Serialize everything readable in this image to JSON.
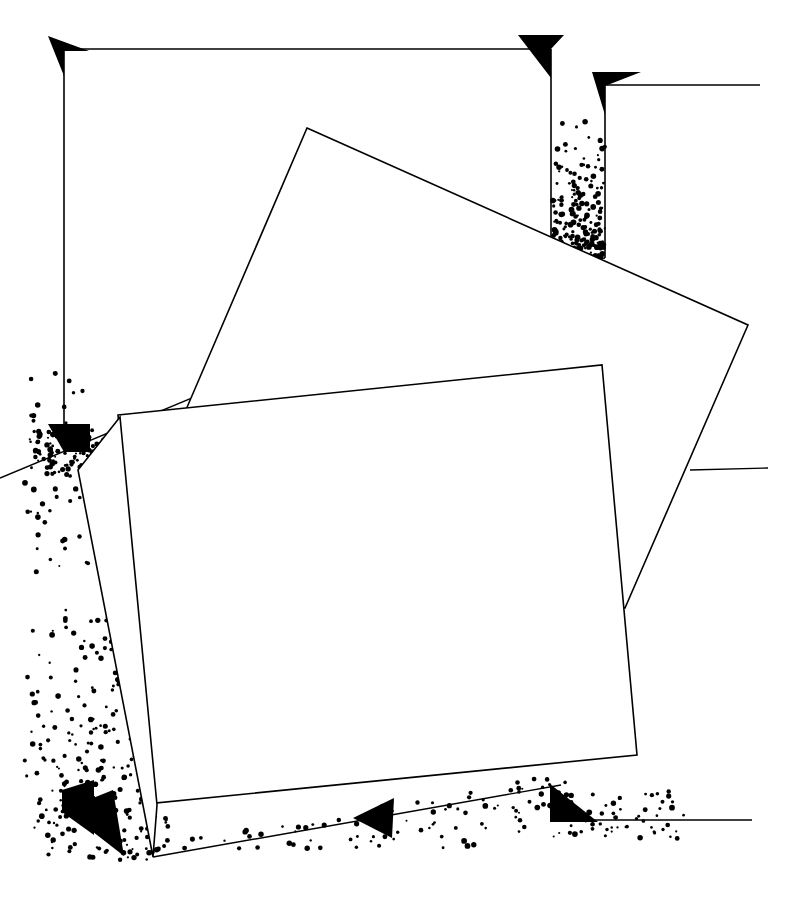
{
  "figure": {
    "background_color": "#ffffff",
    "ink_color": "#000000",
    "canvas": {
      "width": 786,
      "height": 904
    },
    "line_weight_main": 1.6,
    "line_weight_thin": 1.4
  },
  "chart_data": {
    "type": "diagram",
    "xlabel": "",
    "ylabel": "",
    "background": "#ffffff",
    "ink": "#000000",
    "xlim": [
      0,
      786
    ],
    "ylim": [
      0,
      904
    ],
    "grid": false,
    "legend": "none",
    "annotations": [
      "top-left corner bracket with down-left arrowhead",
      "top-right vertical channel filled with granular stipple",
      "mid-left arrowhead at panel edge with granular band",
      "bottom-left paired arrowheads in dense granular field",
      "bottom-center small left-pointing arrowhead on slope",
      "bottom-right arrowhead meeting horizontal baseline",
      "mid-right horizontal leader line touching upper panel edge"
    ]
  },
  "outline_frame": {
    "name": "outer-bracket-frame",
    "description": "Open rectangular bracket: vertical left rail, top rail, and right rail descending into the spill channel.",
    "left_rail": {
      "x": 64,
      "y_top": 48,
      "y_bottom": 434
    },
    "top_rail": {
      "y": 49,
      "x_left": 64,
      "x_right": 551
    },
    "right_rail": {
      "x": 551,
      "y_top": 49,
      "y_bottom": 248
    },
    "second_rail": {
      "x": 605,
      "y_top": 86,
      "y_bottom": 258
    },
    "top_right_leader": {
      "y": 85,
      "x_left": 605,
      "x_right": 760
    }
  },
  "panels": [
    {
      "name": "upper-tilted-panel",
      "corners": [
        {
          "x": 307,
          "y": 128
        },
        {
          "x": 748,
          "y": 325
        },
        {
          "x": 625,
          "y": 608
        },
        {
          "x": 185,
          "y": 412
        }
      ],
      "rotation_note": "rotated clockwise approximately 24 degrees"
    },
    {
      "name": "lower-tilted-panel",
      "corners": [
        {
          "x": 118,
          "y": 415
        },
        {
          "x": 602,
          "y": 365
        },
        {
          "x": 637,
          "y": 755
        },
        {
          "x": 155,
          "y": 803
        }
      ],
      "rotation_note": "rotated counter-clockwise approximately 6 degrees"
    },
    {
      "name": "lower-panel-shadow-edge",
      "corners": [
        {
          "x": 78,
          "y": 470
        },
        {
          "x": 120,
          "y": 417
        },
        {
          "x": 157,
          "y": 805
        },
        {
          "x": 153,
          "y": 857
        }
      ],
      "rotation_note": "thin secondary slab edge offset to the left and below"
    }
  ],
  "ground_lines": [
    {
      "name": "upper-ground-slope",
      "x1": 0,
      "y1": 478,
      "x2": 551,
      "y2": 248,
      "note": "slope meeting the spill channel at upper right"
    },
    {
      "name": "right-ground-slope",
      "x1": 449,
      "y1": 270,
      "x2": 605,
      "y2": 258
    },
    {
      "name": "lower-ground-slope",
      "x1": 153,
      "y1": 857,
      "x2": 561,
      "y2": 785
    },
    {
      "name": "baseline-right",
      "x1": 561,
      "y1": 820,
      "x2": 752,
      "y2": 820
    },
    {
      "name": "mid-right-leader",
      "x1": 690,
      "y1": 470,
      "x2": 768,
      "y2": 468
    }
  ],
  "arrow_markers": [
    {
      "name": "arrow-top-left",
      "direction": "down-left",
      "points": "48,36 89,51 64,51 64,76"
    },
    {
      "name": "arrow-top-center",
      "direction": "down-left",
      "points": "518,35 564,35 551,49 551,78"
    },
    {
      "name": "arrow-top-right",
      "direction": "down-left",
      "points": "592,72 641,72 605,86 605,115"
    },
    {
      "name": "arrow-mid-left",
      "direction": "down-left",
      "points": "48,424 90,424 90,452 64,452"
    },
    {
      "name": "arrow-bottom-left-upper",
      "direction": "down-left",
      "points": "62,790 94,780 94,835 62,812"
    },
    {
      "name": "arrow-bottom-left-lower",
      "direction": "down-right",
      "points": "88,800 113,790 124,856 88,828"
    },
    {
      "name": "arrow-bottom-center",
      "direction": "left",
      "points": "353,818 394,798 392,838"
    },
    {
      "name": "arrow-bottom-right",
      "direction": "down-left",
      "points": "550,784 550,822 598,822"
    }
  ],
  "stipple_fields": [
    {
      "name": "stipple-top-channel",
      "description": "granular column between the two right rails, dense at the base",
      "seed": 11,
      "region": {
        "x": 552,
        "y": 110,
        "w": 53,
        "h": 148
      },
      "count": 190,
      "gradient": "top-sparse"
    },
    {
      "name": "stipple-mid-left-band",
      "description": "granular band spilling left from the panel edge",
      "seed": 23,
      "region": {
        "x": 30,
        "y": 428,
        "w": 90,
        "h": 52
      },
      "count": 150,
      "gradient": "uniform"
    },
    {
      "name": "stipple-mid-left-scatter",
      "description": "scattered grains above and below the mid-left band",
      "seed": 31,
      "region": {
        "x": 24,
        "y": 372,
        "w": 70,
        "h": 200
      },
      "count": 55,
      "gradient": "uniform"
    },
    {
      "name": "stipple-bottom-left-field",
      "description": "dense granular field along the lower-left slab edge",
      "seed": 47,
      "region": {
        "x": 20,
        "y": 600,
        "w": 200,
        "h": 260
      },
      "count": 420,
      "gradient": "edge-dense"
    },
    {
      "name": "stipple-bottom-slope",
      "description": "grains scattered along the lower ground slope",
      "seed": 59,
      "region": {
        "x": 150,
        "y": 770,
        "w": 430,
        "h": 80
      },
      "count": 210,
      "gradient": "uniform"
    },
    {
      "name": "stipple-bottom-right",
      "description": "grains trailing right of the bottom-right arrowhead",
      "seed": 67,
      "region": {
        "x": 545,
        "y": 790,
        "w": 140,
        "h": 50
      },
      "count": 60,
      "gradient": "uniform"
    }
  ]
}
